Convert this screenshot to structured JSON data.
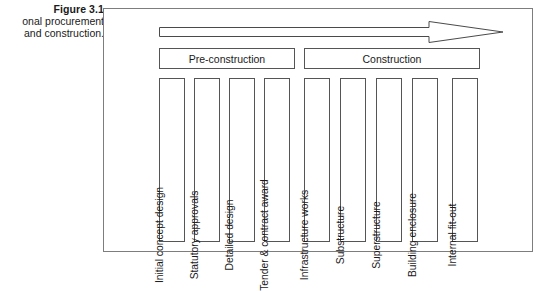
{
  "caption": {
    "title": "Figure 3.1",
    "line2": "onal procurement",
    "line3": "and construction."
  },
  "diagram": {
    "arrow": {
      "name": "progression-arrow",
      "direction": "left-to-right"
    },
    "phases": [
      {
        "id": "pre-construction",
        "label": "Pre-construction"
      },
      {
        "id": "construction",
        "label": "Construction"
      }
    ],
    "stages": [
      {
        "phase": "pre-construction",
        "label": "Initial concept design"
      },
      {
        "phase": "pre-construction",
        "label": "Statutory approvals"
      },
      {
        "phase": "pre-construction",
        "label": "Detailed design"
      },
      {
        "phase": "pre-construction",
        "label": "Tender & contract award"
      },
      {
        "phase": "construction",
        "label": "Infrastructure works"
      },
      {
        "phase": "construction",
        "label": "Substructure"
      },
      {
        "phase": "construction",
        "label": "Superstructure"
      },
      {
        "phase": "construction",
        "label": "Building enclosure"
      },
      {
        "phase": "construction",
        "label": "Internal fit-out"
      }
    ]
  },
  "colors": {
    "frame_border": "#7d7d7d",
    "box_border": "#555555",
    "text": "#1a1a1a",
    "background": "#ffffff"
  }
}
